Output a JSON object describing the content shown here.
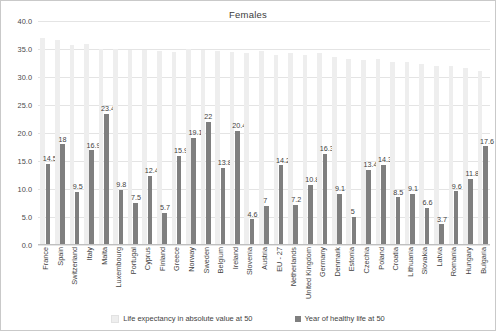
{
  "chart_data": {
    "type": "bar",
    "title": "Females",
    "xlabel": "",
    "ylabel": "",
    "ylim": [
      0,
      40
    ],
    "ytick_step": 5,
    "ytick_labels": [
      "40.0",
      "35.0",
      "30.0",
      "25.0",
      "20.0",
      "15.0",
      "10.0",
      "5.0",
      "0.0"
    ],
    "grid": true,
    "legend_position": "bottom",
    "categories": [
      "France",
      "Spain",
      "Switzerland",
      "Italy",
      "Malta",
      "Luxembourg",
      "Portugal",
      "Cyprus",
      "Finland",
      "Greece",
      "Norway",
      "Sweden",
      "Belgium",
      "Ireland",
      "Slovenia",
      "Austria",
      "EU - 27",
      "Netherlands",
      "United Kingdom",
      "Germany",
      "Denmark",
      "Estonia",
      "Czechia",
      "Poland",
      "Croatia",
      "Lithuania",
      "Slovakia",
      "Latvia",
      "Romania",
      "Hungary",
      "Bulgaria"
    ],
    "series": [
      {
        "name": "Life expectancy in absolute value at 50",
        "color": "#eeeeee",
        "show_labels": false,
        "values": [
          37.0,
          36.6,
          35.8,
          35.9,
          35.0,
          35.0,
          34.8,
          34.8,
          34.7,
          34.5,
          35.0,
          34.8,
          34.6,
          34.5,
          34.3,
          34.6,
          34.0,
          34.3,
          34.0,
          34.2,
          33.6,
          33.2,
          33.0,
          33.2,
          32.6,
          32.6,
          32.4,
          32.0,
          32.0,
          31.6,
          31.0
        ]
      },
      {
        "name": "Year of healthy life at 50",
        "color": "#7f7f7f",
        "show_labels": true,
        "values": [
          14.5,
          18,
          9.5,
          16.9,
          23.4,
          9.8,
          7.5,
          12.4,
          5.7,
          15.9,
          19.1,
          22,
          13.8,
          20.4,
          4.6,
          7,
          14.2,
          7.2,
          10.8,
          16.3,
          9.1,
          5,
          13.4,
          14.3,
          8.5,
          9.1,
          6.6,
          3.7,
          9.6,
          11.8,
          17.6
        ],
        "labels": [
          "14.5",
          "18",
          "9.5",
          "16.9",
          "23.4",
          "9.8",
          "7.5",
          "12.4",
          "5.7",
          "15.9",
          "19.1",
          "22",
          "13.8",
          "20.4",
          "4.6",
          "7",
          "14.2",
          "7.2",
          "10.8",
          "16.3",
          "9.1",
          "5",
          "13.4",
          "14.3",
          "8.5",
          "9.1",
          "6.6",
          "3.7",
          "9.6",
          "11.8",
          "17.6"
        ]
      }
    ]
  }
}
